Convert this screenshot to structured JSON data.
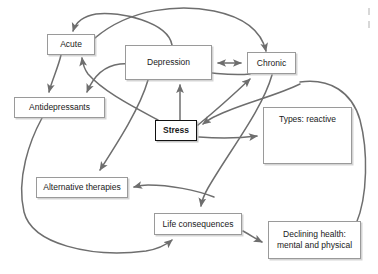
{
  "diagram": {
    "background_color": "#ffffff",
    "line_color": "#6e6e6e",
    "box_border_color": "#9a9a9a",
    "emphasis_border_color": "#111111",
    "nodes": [
      {
        "id": "acute",
        "label": "Acute",
        "x": 47,
        "y": 34,
        "w": 48,
        "h": 21,
        "emphasis": false,
        "align": "center"
      },
      {
        "id": "depression",
        "label": "Depression",
        "x": 125,
        "y": 45,
        "w": 87,
        "h": 35,
        "emphasis": false,
        "align": "center"
      },
      {
        "id": "chronic",
        "label": "Chronic",
        "x": 247,
        "y": 52,
        "w": 49,
        "h": 22,
        "emphasis": false,
        "align": "center"
      },
      {
        "id": "antidepressants",
        "label": "Antidepressants",
        "x": 14,
        "y": 97,
        "w": 91,
        "h": 21,
        "emphasis": false,
        "align": "center"
      },
      {
        "id": "stress",
        "label": "Stress",
        "x": 155,
        "y": 120,
        "w": 42,
        "h": 21,
        "emphasis": true,
        "align": "center"
      },
      {
        "id": "types_reactive",
        "label": "Types: reactive",
        "x": 263,
        "y": 107,
        "w": 89,
        "h": 57,
        "emphasis": false,
        "align": "top"
      },
      {
        "id": "alternative_therapies",
        "label": "Alternative therapies",
        "x": 36,
        "y": 177,
        "w": 92,
        "h": 21,
        "emphasis": false,
        "align": "center"
      },
      {
        "id": "life_consequences",
        "label": "Life consequences",
        "x": 154,
        "y": 213,
        "w": 88,
        "h": 22,
        "emphasis": false,
        "align": "center"
      },
      {
        "id": "declining_health",
        "label": "Declining health:\nmental and physical",
        "x": 268,
        "y": 221,
        "w": 93,
        "h": 38,
        "emphasis": false,
        "align": "center"
      }
    ],
    "edges": [
      {
        "id": "depression-to-acute",
        "from": "depression",
        "to": "acute",
        "arrow": "single"
      },
      {
        "id": "acute-to-chronic",
        "from": "acute",
        "to": "chronic",
        "arrow": "single"
      },
      {
        "id": "acute-to-antidepressants",
        "from": "acute",
        "to": "antidepressants",
        "arrow": "single"
      },
      {
        "id": "chronic-to-antidepressants",
        "from": "chronic",
        "to": "antidepressants",
        "arrow": "single"
      },
      {
        "id": "stress-to-acute",
        "from": "stress",
        "to": "acute",
        "arrow": "single"
      },
      {
        "id": "depression-to-alternative-therapies",
        "from": "depression",
        "to": "alternative-therapies",
        "arrow": "single"
      },
      {
        "id": "depression-chronic",
        "from": "depression",
        "to": "chronic",
        "arrow": "double"
      },
      {
        "id": "stress-to-depression",
        "from": "stress",
        "to": "depression",
        "arrow": "single"
      },
      {
        "id": "stress-to-chronic",
        "from": "stress",
        "to": "chronic",
        "arrow": "single"
      },
      {
        "id": "types-to-stress",
        "from": "types-reactive",
        "to": "stress",
        "arrow": "single"
      },
      {
        "id": "stress-to-types",
        "from": "stress",
        "to": "types-reactive",
        "arrow": "single"
      },
      {
        "id": "chronic-to-life-consequences",
        "from": "chronic",
        "to": "life-consequences",
        "arrow": "single"
      },
      {
        "id": "declining-health-to-alternative-therapies",
        "from": "declining-health",
        "to": "alternative-therapies",
        "arrow": "single"
      },
      {
        "id": "antidepressants-to-life-consequences",
        "from": "antidepressants",
        "to": "life-consequences",
        "arrow": "single"
      },
      {
        "id": "life-consequences-to-declining-health",
        "from": "life-consequences",
        "to": "declining-health",
        "arrow": "single"
      },
      {
        "id": "declining-health-to-types",
        "from": "declining-health",
        "to": "types-reactive",
        "arrow": "none"
      }
    ]
  }
}
